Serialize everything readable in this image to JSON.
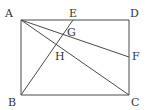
{
  "diagram": {
    "type": "geometry",
    "points": {
      "A": {
        "x": 21,
        "y": 20,
        "label": "A",
        "lx": 5,
        "ly": 17
      },
      "E": {
        "x": 73,
        "y": 20,
        "label": "E",
        "lx": 69,
        "ly": 17
      },
      "D": {
        "x": 129,
        "y": 20,
        "label": "D",
        "lx": 130,
        "ly": 17
      },
      "G": {
        "x": 64,
        "y": 33,
        "label": "G",
        "lx": 67,
        "ly": 36
      },
      "H": {
        "x": 57,
        "y": 44,
        "label": "H",
        "lx": 55,
        "ly": 60
      },
      "F": {
        "x": 129,
        "y": 57,
        "label": "F",
        "lx": 132,
        "ly": 60
      },
      "B": {
        "x": 21,
        "y": 95,
        "label": "B",
        "lx": 8,
        "ly": 106
      },
      "C": {
        "x": 129,
        "y": 95,
        "label": "C",
        "lx": 131,
        "ly": 106
      }
    },
    "segments": [
      [
        "A",
        "D"
      ],
      [
        "D",
        "C"
      ],
      [
        "C",
        "B"
      ],
      [
        "B",
        "A"
      ],
      [
        "A",
        "F"
      ],
      [
        "A",
        "C"
      ],
      [
        "B",
        "E"
      ]
    ],
    "colors": {
      "line": "#4a4a4a",
      "text": "#333333",
      "background": "#ffffff"
    }
  }
}
